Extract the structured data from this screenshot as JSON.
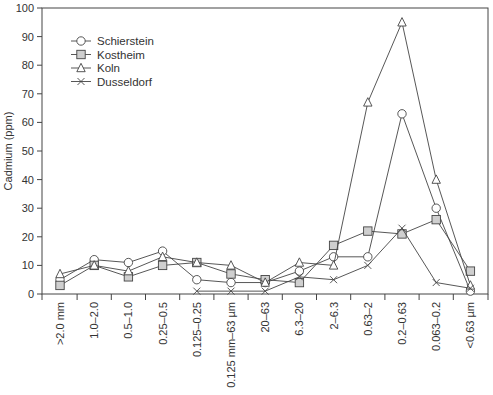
{
  "chart_data": {
    "type": "line",
    "title": "",
    "xlabel": "",
    "ylabel": "Cadmium (ppm)",
    "ylim": [
      0,
      100
    ],
    "yticks": [
      0,
      10,
      20,
      30,
      40,
      50,
      60,
      70,
      80,
      90,
      100
    ],
    "grid": false,
    "legend_position": "top-left",
    "categories": [
      ">2.0 mm",
      "1.0–2.0",
      "0.5–1.0",
      "0.25–0.5",
      "0.125–0.25",
      "0.125 mm–63 µm",
      "20–63",
      "6.3–20",
      "2–6.3",
      "0.63–2",
      "0.2–0.63",
      "0.063–0.2",
      "<0.63 µm"
    ],
    "series": [
      {
        "name": "Schierstein",
        "marker": "circle",
        "values": [
          5,
          12,
          11,
          15,
          5,
          4,
          4,
          8,
          13,
          13,
          63,
          30,
          1
        ]
      },
      {
        "name": "Kostheim",
        "marker": "square",
        "values": [
          3,
          10,
          6,
          10,
          11,
          7,
          5,
          4,
          17,
          22,
          21,
          26,
          8
        ]
      },
      {
        "name": "Koln",
        "marker": "triangle",
        "values": [
          7,
          10,
          8,
          13,
          11,
          10,
          4,
          11,
          10,
          67,
          95,
          40,
          3
        ]
      },
      {
        "name": "Dusseldorf",
        "marker": "cross",
        "values": [
          null,
          null,
          null,
          null,
          1,
          1,
          1,
          6,
          5,
          10,
          23,
          4,
          2
        ]
      }
    ]
  }
}
